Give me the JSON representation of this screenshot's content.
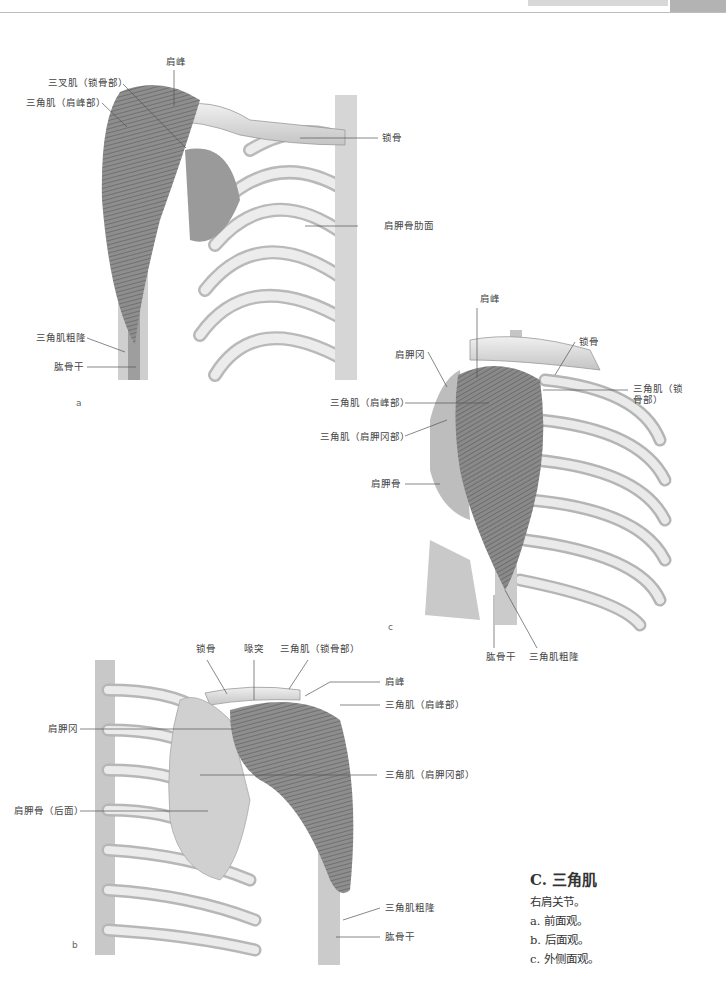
{
  "header": {
    "running_title": "",
    "tab_color": "#b3b3b3"
  },
  "figure_a": {
    "panel_letter": "a",
    "labels": {
      "acromion": "肩峰",
      "deltoid_clavicular_mislabel": "三叉肌（锁骨部）",
      "deltoid_acromial": "三角肌（肩峰部）",
      "clavicle": "锁骨",
      "scapula_costal": "肩胛骨肋面",
      "deltoid_tuberosity": "三角肌粗隆",
      "humerus_shaft": "肱骨干"
    }
  },
  "figure_c": {
    "panel_letter": "c",
    "labels": {
      "acromion": "肩峰",
      "scapular_spine": "肩胛冈",
      "clavicle": "锁骨",
      "deltoid_clavicular_line1": "三角肌（锁",
      "deltoid_clavicular_line2": "骨部）",
      "deltoid_acromial": "三角肌（肩峰部）",
      "deltoid_spinal": "三角肌（肩胛冈部）",
      "scapula": "肩胛骨",
      "humerus_shaft": "肱骨干",
      "deltoid_tuberosity": "三角肌粗隆"
    }
  },
  "figure_b": {
    "panel_letter": "b",
    "labels": {
      "clavicle": "锁骨",
      "coracoid": "喙突",
      "deltoid_clavicular": "三角肌（锁骨部）",
      "acromion": "肩峰",
      "deltoid_acromial": "三角肌（肩峰部）",
      "scapular_spine": "肩胛冈",
      "deltoid_spinal": "三角肌（肩胛冈部）",
      "scapula_posterior": "肩胛骨（后面）",
      "deltoid_tuberosity": "三角肌粗隆",
      "humerus_shaft": "肱骨干"
    }
  },
  "caption": {
    "title": "C. 三角肌",
    "lines": [
      "右肩关节。",
      "a. 前面观。",
      "b. 后面观。",
      "c. 外侧面观。"
    ]
  }
}
